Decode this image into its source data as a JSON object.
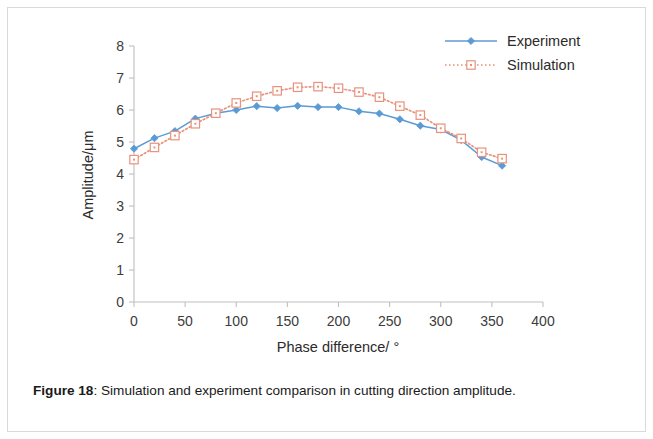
{
  "figure": {
    "caption_label": "Figure 18",
    "caption_separator": ":",
    "caption_text": "Simulation and experiment comparison in cutting direction amplitude."
  },
  "colors": {
    "experiment": "#5B9BD5",
    "simulation": "#E8927C",
    "axis": "#bfbfbf",
    "tick_text": "#3c3c3c",
    "page_border": "#d9d9d9",
    "background": "#ffffff"
  },
  "chart_data": {
    "type": "line",
    "title": "",
    "xlabel": "Phase difference/ °",
    "ylabel": "Amplitude/μm",
    "xlim": [
      0,
      400
    ],
    "ylim": [
      0,
      8
    ],
    "xticks": [
      0,
      50,
      100,
      150,
      200,
      250,
      300,
      350,
      400
    ],
    "yticks": [
      0,
      1,
      2,
      3,
      4,
      5,
      6,
      7,
      8
    ],
    "xtick_labels": [
      "0",
      "50",
      "100",
      "150",
      "200",
      "250",
      "300",
      "350",
      "400"
    ],
    "ytick_labels": [
      "0",
      "1",
      "2",
      "3",
      "4",
      "5",
      "6",
      "7",
      "8"
    ],
    "grid": false,
    "legend_position": "top-right",
    "x": [
      0,
      20,
      40,
      60,
      80,
      100,
      120,
      140,
      160,
      180,
      200,
      220,
      240,
      260,
      280,
      300,
      320,
      340,
      360
    ],
    "series": [
      {
        "name": "Experiment",
        "color": "#5B9BD5",
        "linestyle": "solid",
        "marker": "diamond",
        "values": [
          4.79,
          5.12,
          5.34,
          5.73,
          5.9,
          6.0,
          6.12,
          6.06,
          6.13,
          6.09,
          6.09,
          5.96,
          5.89,
          5.71,
          5.51,
          5.39,
          5.06,
          4.53,
          4.26
        ]
      },
      {
        "name": "Simulation",
        "color": "#E8927C",
        "linestyle": "dotted",
        "marker": "open-square",
        "values": [
          4.45,
          4.83,
          5.2,
          5.57,
          5.9,
          6.22,
          6.43,
          6.6,
          6.71,
          6.73,
          6.68,
          6.56,
          6.4,
          6.12,
          5.84,
          5.43,
          5.11,
          4.68,
          4.48
        ]
      }
    ]
  }
}
